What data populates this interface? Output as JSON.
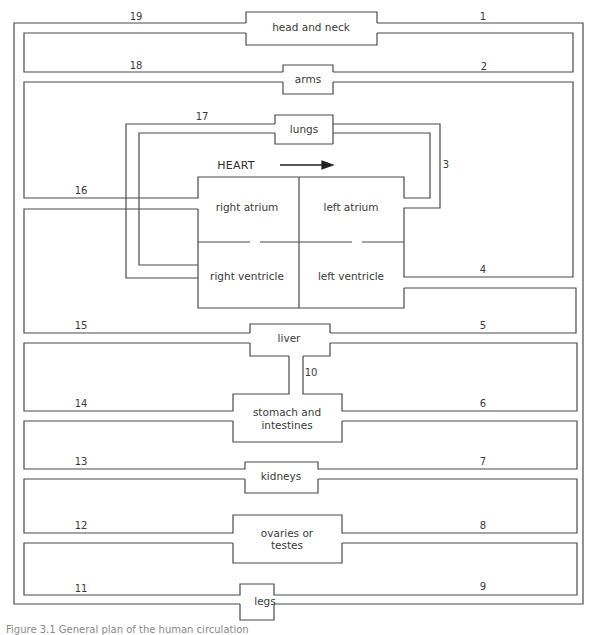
{
  "diagram": {
    "title": "HEART",
    "organs": {
      "head_and_neck": "head and neck",
      "arms": "arms",
      "lungs": "lungs",
      "right_atrium": "right atrium",
      "left_atrium": "left atrium",
      "right_ventricle": "right ventricle",
      "left_ventricle": "left ventricle",
      "liver": "liver",
      "stomach_line1": "stomach and",
      "stomach_line2": "intestines",
      "kidneys": "kidneys",
      "gonads_line1": "ovaries or",
      "gonads_line2": "testes",
      "legs": "legs"
    },
    "vessel_numbers": {
      "n1": "1",
      "n2": "2",
      "n3": "3",
      "n4": "4",
      "n5": "5",
      "n6": "6",
      "n7": "7",
      "n8": "8",
      "n9": "9",
      "n10": "10",
      "n11": "11",
      "n12": "12",
      "n13": "13",
      "n14": "14",
      "n15": "15",
      "n16": "16",
      "n17": "17",
      "n18": "18",
      "n19": "19"
    },
    "caption": "Figure 3.1  General plan of the human circulation",
    "colors": {
      "line": "#4a4a4a",
      "text": "#3a3a3a",
      "background": "#ffffff"
    }
  }
}
